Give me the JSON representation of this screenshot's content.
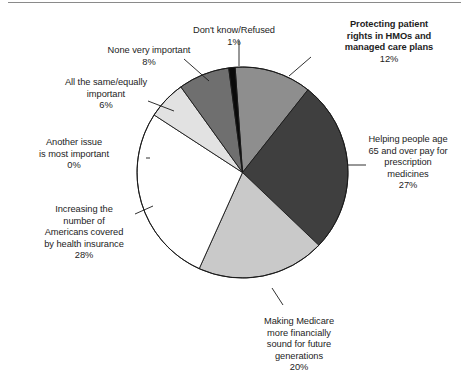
{
  "figure": {
    "name": "most-important-health-care-priority-pie-chart",
    "top_rule": true
  },
  "chart_data": {
    "type": "pie",
    "title": "",
    "subtitle": "",
    "xlabel": "",
    "ylabel": "",
    "legend_position": "callout-labels",
    "grid": false,
    "total": 100,
    "units": "percent",
    "start_angle_deg": -4,
    "direction": "clockwise",
    "categories": [
      "Protecting patient rights in HMOs and managed care plans",
      "Helping people age 65 and over pay for prescription medicines",
      "Making Medicare more financially sound for future generations",
      "Increasing the number of Americans covered by health insurance",
      "Another issue is most important",
      "All the same/equally important",
      "None very important",
      "Don't know/Refused"
    ],
    "values": [
      12,
      27,
      20,
      28,
      0,
      6,
      8,
      1
    ],
    "colors": [
      "#8e8e8e",
      "#3f3f3f",
      "#c9c9c9",
      "#ffffff",
      "#ffffff",
      "#e2e2e2",
      "#6f6f6f",
      "#0a0a0a"
    ],
    "slice_outline_color": "#1a1a1a",
    "leader_line_color": "#1a1a1a",
    "slices": [
      {
        "id": "protecting-patient-rights",
        "label": "Protecting patient\nrights in HMOs and\nmanaged care plans",
        "percent_text": "12%",
        "value": 12,
        "color": "#8e8e8e",
        "bold": true
      },
      {
        "id": "helping-people-age-65",
        "label": "Helping people age\n65 and over pay for\nprescription\nmedicines",
        "percent_text": "27%",
        "value": 27,
        "color": "#3f3f3f",
        "bold": false
      },
      {
        "id": "making-medicare-sound",
        "label": "Making Medicare\nmore financially\nsound for future\ngenerations",
        "percent_text": "20%",
        "value": 20,
        "color": "#c9c9c9",
        "bold": false
      },
      {
        "id": "increasing-coverage",
        "label": "Increasing the\nnumber of\nAmericans covered\nby health insurance",
        "percent_text": "28%",
        "value": 28,
        "color": "#ffffff",
        "bold": false
      },
      {
        "id": "another-issue",
        "label": "Another issue\nis most important",
        "percent_text": "0%",
        "value": 0,
        "color": "#ffffff",
        "bold": false
      },
      {
        "id": "all-the-same",
        "label": "All the same/equally\nimportant",
        "percent_text": "6%",
        "value": 6,
        "color": "#e2e2e2",
        "bold": false
      },
      {
        "id": "none-very-important",
        "label": "None very important",
        "percent_text": "8%",
        "value": 8,
        "color": "#6f6f6f",
        "bold": false
      },
      {
        "id": "dont-know-refused",
        "label": "Don't know/Refused",
        "percent_text": "1%",
        "value": 1,
        "color": "#0a0a0a",
        "bold": false
      }
    ]
  }
}
